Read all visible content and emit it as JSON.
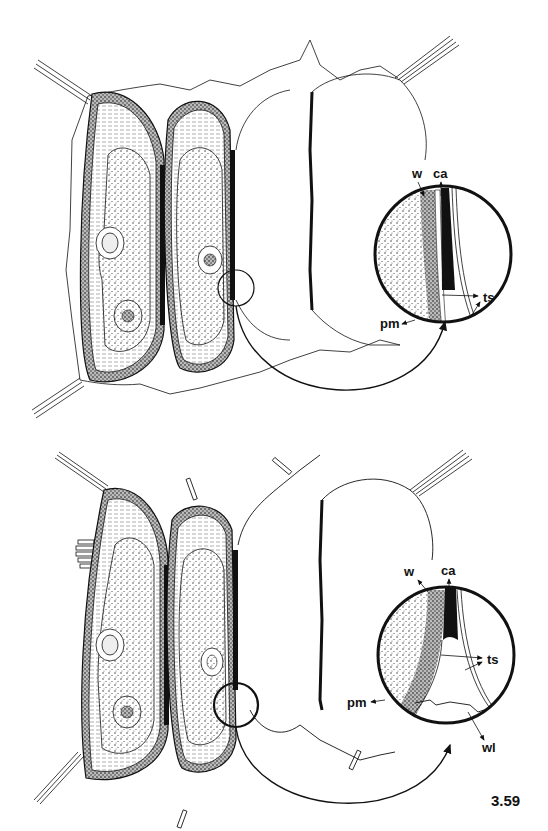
{
  "figure": {
    "number": "3.59",
    "panels": [
      {
        "id": "top",
        "description": "Two adjacent cells separated by a thin wall; right side shows cell separation with magnified inset",
        "labels": {
          "w": "w",
          "ca": "ca",
          "ts": "ts",
          "pm": "pm"
        }
      },
      {
        "id": "bottom",
        "description": "Same cells at a later stage with magnified inset showing wall separation",
        "labels": {
          "w": "w",
          "ca": "ca",
          "ts": "ts",
          "pm": "pm",
          "wl": "wl"
        }
      }
    ]
  },
  "colors": {
    "ink": "#111111",
    "paper": "#ffffff",
    "stipple": "#d9d9d9"
  }
}
